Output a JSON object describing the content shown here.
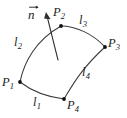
{
  "figure": {
    "background_color": "#ffffff",
    "stroke_color": "#3a3a3a",
    "label_color": "#1a1a1a",
    "vertex_color": "#111111",
    "vertices": [
      {
        "id": "P1",
        "base": "P",
        "sub": "1",
        "x": 20,
        "y": 82,
        "label_x": 2,
        "label_y": 76
      },
      {
        "id": "P2",
        "base": "P",
        "sub": "2",
        "x": 61,
        "y": 26,
        "label_x": 53,
        "label_y": 6
      },
      {
        "id": "P3",
        "base": "P",
        "sub": "3",
        "x": 105,
        "y": 47,
        "label_x": 108,
        "label_y": 37
      },
      {
        "id": "P4",
        "base": "P",
        "sub": "4",
        "x": 64,
        "y": 99,
        "label_x": 67,
        "label_y": 99
      }
    ],
    "edges": [
      {
        "id": "l1",
        "base": "l",
        "sub": "1",
        "from": "P1",
        "to": "P4",
        "label_x": 33,
        "label_y": 96
      },
      {
        "id": "l2",
        "base": "l",
        "sub": "2",
        "from": "P1",
        "to": "P2",
        "label_x": 14,
        "label_y": 36
      },
      {
        "id": "l3",
        "base": "l",
        "sub": "3",
        "from": "P2",
        "to": "P3",
        "label_x": 79,
        "label_y": 14
      },
      {
        "id": "l4",
        "base": "l",
        "sub": "4",
        "from": "P4",
        "to": "P3",
        "label_x": 82,
        "label_y": 66
      }
    ],
    "normal_vector": {
      "id": "n",
      "base": "n",
      "label_x": 28,
      "label_y": 7,
      "tail_x": 58,
      "tail_y": 60,
      "tip_x": 46,
      "tip_y": 13
    }
  }
}
